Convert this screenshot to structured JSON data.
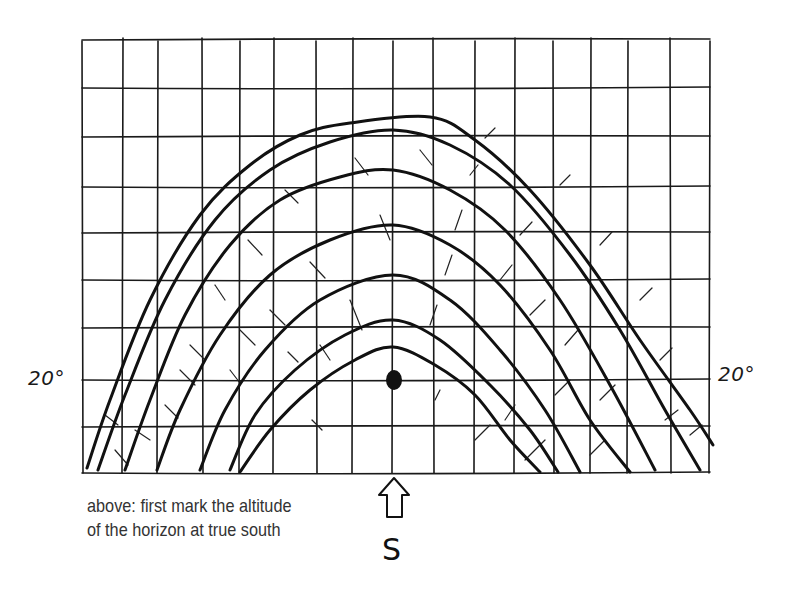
{
  "diagram": {
    "colors": {
      "ink": "#111111",
      "background": "#ffffff",
      "caption": "#333333"
    },
    "grid": {
      "x_lines": [
        82,
        123,
        158,
        202,
        240,
        274,
        316,
        353,
        393,
        433,
        475,
        515,
        553,
        591,
        628,
        670,
        710
      ],
      "y_lines": [
        40,
        88,
        137,
        187,
        233,
        280,
        328,
        380,
        427,
        473
      ],
      "columns": 16,
      "rows": 9
    },
    "labels": {
      "left_altitude": "20°",
      "right_altitude": "20°",
      "south_letter": "S",
      "south_arrow": "up-arrow-icon"
    },
    "caption": {
      "line1": "above: first mark the altitude",
      "line2": "of the horizon at true south"
    },
    "horizon_mark": {
      "x": 394,
      "y": 380,
      "label": "altitude of horizon at true south",
      "altitude_deg": 20
    },
    "sun_paths": [
      {
        "name": "path-1",
        "points": [
          [
            87,
            468
          ],
          [
            110,
            400
          ],
          [
            150,
            300
          ],
          [
            200,
            215
          ],
          [
            250,
            165
          ],
          [
            300,
            135
          ],
          [
            350,
            123
          ],
          [
            430,
            117
          ],
          [
            475,
            140
          ],
          [
            530,
            190
          ],
          [
            590,
            265
          ],
          [
            640,
            340
          ],
          [
            690,
            410
          ],
          [
            713,
            445
          ]
        ]
      },
      {
        "name": "path-2",
        "points": [
          [
            98,
            470
          ],
          [
            125,
            395
          ],
          [
            165,
            300
          ],
          [
            215,
            220
          ],
          [
            270,
            170
          ],
          [
            330,
            142
          ],
          [
            393,
            130
          ],
          [
            450,
            145
          ],
          [
            510,
            185
          ],
          [
            570,
            255
          ],
          [
            620,
            330
          ],
          [
            665,
            410
          ],
          [
            700,
            470
          ]
        ]
      },
      {
        "name": "path-3",
        "points": [
          [
            125,
            470
          ],
          [
            150,
            400
          ],
          [
            185,
            315
          ],
          [
            230,
            245
          ],
          [
            280,
            200
          ],
          [
            340,
            177
          ],
          [
            393,
            170
          ],
          [
            450,
            190
          ],
          [
            505,
            230
          ],
          [
            560,
            300
          ],
          [
            610,
            385
          ],
          [
            655,
            470
          ]
        ]
      },
      {
        "name": "path-4",
        "points": [
          [
            157,
            470
          ],
          [
            180,
            410
          ],
          [
            220,
            335
          ],
          [
            270,
            275
          ],
          [
            330,
            240
          ],
          [
            393,
            225
          ],
          [
            450,
            245
          ],
          [
            500,
            285
          ],
          [
            550,
            350
          ],
          [
            590,
            420
          ],
          [
            630,
            472
          ]
        ]
      },
      {
        "name": "path-5",
        "points": [
          [
            200,
            470
          ],
          [
            225,
            410
          ],
          [
            265,
            350
          ],
          [
            320,
            300
          ],
          [
            393,
            275
          ],
          [
            450,
            300
          ],
          [
            500,
            350
          ],
          [
            545,
            410
          ],
          [
            580,
            472
          ]
        ]
      },
      {
        "name": "path-6",
        "points": [
          [
            230,
            470
          ],
          [
            255,
            415
          ],
          [
            295,
            370
          ],
          [
            345,
            335
          ],
          [
            393,
            320
          ],
          [
            440,
            340
          ],
          [
            490,
            385
          ],
          [
            530,
            430
          ],
          [
            558,
            472
          ]
        ]
      },
      {
        "name": "path-7",
        "points": [
          [
            240,
            472
          ],
          [
            270,
            430
          ],
          [
            310,
            390
          ],
          [
            355,
            360
          ],
          [
            393,
            347
          ],
          [
            435,
            365
          ],
          [
            475,
            395
          ],
          [
            510,
            440
          ],
          [
            540,
            472
          ]
        ]
      }
    ],
    "hour_ticks": [
      [
        [
          115,
          450
        ],
        [
          128,
          465
        ]
      ],
      [
        [
          105,
          415
        ],
        [
          118,
          425
        ]
      ],
      [
        [
          180,
          370
        ],
        [
          195,
          385
        ]
      ],
      [
        [
          240,
          330
        ],
        [
          255,
          345
        ]
      ],
      [
        [
          215,
          285
        ],
        [
          225,
          300
        ]
      ],
      [
        [
          248,
          240
        ],
        [
          262,
          255
        ]
      ],
      [
        [
          285,
          190
        ],
        [
          298,
          203
        ]
      ],
      [
        [
          355,
          158
        ],
        [
          368,
          175
        ]
      ],
      [
        [
          420,
          150
        ],
        [
          432,
          165
        ]
      ],
      [
        [
          135,
          430
        ],
        [
          150,
          440
        ]
      ],
      [
        [
          165,
          405
        ],
        [
          178,
          418
        ]
      ],
      [
        [
          190,
          345
        ],
        [
          205,
          360
        ]
      ],
      [
        [
          230,
          370
        ],
        [
          240,
          383
        ]
      ],
      [
        [
          270,
          310
        ],
        [
          285,
          325
        ]
      ],
      [
        [
          310,
          262
        ],
        [
          325,
          278
        ]
      ],
      [
        [
          380,
          215
        ],
        [
          390,
          240
        ]
      ],
      [
        [
          320,
          345
        ],
        [
          330,
          360
        ]
      ],
      [
        [
          350,
          300
        ],
        [
          362,
          330
        ]
      ],
      [
        [
          288,
          352
        ],
        [
          298,
          362
        ]
      ],
      [
        [
          312,
          420
        ],
        [
          322,
          430
        ]
      ],
      [
        [
          485,
          138
        ],
        [
          495,
          128
        ]
      ],
      [
        [
          560,
          185
        ],
        [
          570,
          175
        ]
      ],
      [
        [
          520,
          235
        ],
        [
          532,
          222
        ]
      ],
      [
        [
          600,
          245
        ],
        [
          612,
          232
        ]
      ],
      [
        [
          500,
          280
        ],
        [
          512,
          265
        ]
      ],
      [
        [
          530,
          315
        ],
        [
          545,
          300
        ]
      ],
      [
        [
          640,
          300
        ],
        [
          652,
          288
        ]
      ],
      [
        [
          565,
          345
        ],
        [
          578,
          330
        ]
      ],
      [
        [
          600,
          400
        ],
        [
          615,
          385
        ]
      ],
      [
        [
          660,
          360
        ],
        [
          672,
          348
        ]
      ],
      [
        [
          555,
          395
        ],
        [
          570,
          380
        ]
      ],
      [
        [
          525,
          460
        ],
        [
          545,
          440
        ]
      ],
      [
        [
          590,
          455
        ],
        [
          605,
          440
        ]
      ],
      [
        [
          665,
          420
        ],
        [
          678,
          410
        ]
      ],
      [
        [
          690,
          435
        ],
        [
          702,
          425
        ]
      ],
      [
        [
          470,
          175
        ],
        [
          478,
          165
        ]
      ],
      [
        [
          455,
          230
        ],
        [
          462,
          210
        ]
      ],
      [
        [
          445,
          275
        ],
        [
          452,
          255
        ]
      ],
      [
        [
          430,
          325
        ],
        [
          437,
          305
        ]
      ],
      [
        [
          435,
          400
        ],
        [
          440,
          390
        ]
      ],
      [
        [
          505,
          420
        ],
        [
          515,
          405
        ]
      ],
      [
        [
          475,
          440
        ],
        [
          490,
          425
        ]
      ]
    ]
  }
}
